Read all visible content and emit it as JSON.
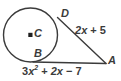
{
  "figure": {
    "type": "geometry-diagram",
    "stroke_color": "#3b3b3b",
    "background_color": "#ffffff",
    "points": {
      "center": "C",
      "tangency_top": "D",
      "tangency_bottom": "B",
      "external": "A"
    },
    "labels": {
      "tangent_da": {
        "coefficient": "2",
        "variable": "x",
        "operator": "+",
        "constant": "5",
        "text": "2x + 5"
      },
      "tangent_ba": {
        "term1_coefficient": "3",
        "term1_variable": "x",
        "term1_exponent": "2",
        "operator1": "+",
        "term2": "2x",
        "operator2": "−",
        "term3": "7",
        "text": "3x² + 2x − 7"
      }
    }
  }
}
